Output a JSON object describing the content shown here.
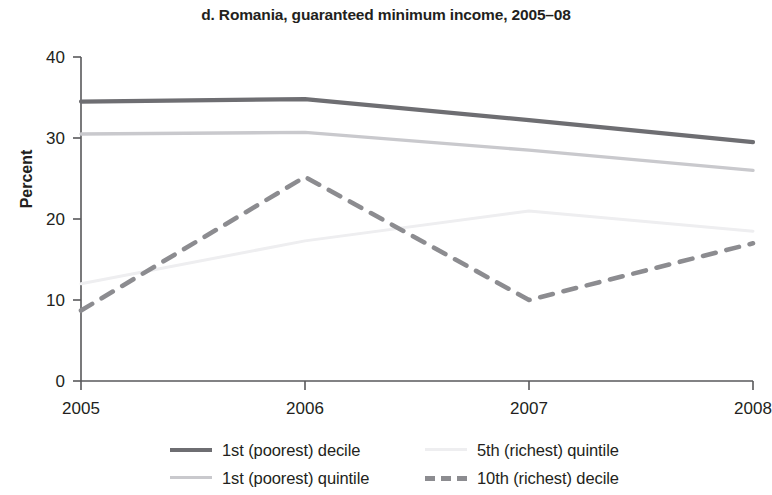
{
  "chart_data": {
    "type": "line",
    "title": "d. Romania, guaranteed minimum income, 2005–08",
    "xlabel": "",
    "ylabel": "Percent",
    "x": [
      2005,
      2006,
      2007,
      2008
    ],
    "xtick_labels": [
      "2005",
      "2006",
      "2007",
      "2008"
    ],
    "ytick_labels": [
      "0",
      "10",
      "20",
      "30",
      "40"
    ],
    "ytick_values": [
      0,
      10,
      20,
      30,
      40
    ],
    "ylim": [
      0,
      40
    ],
    "xlim": [
      2005,
      2008
    ],
    "grid": false,
    "legend_position": "bottom",
    "series": [
      {
        "name": "1st (poorest) decile",
        "values": [
          34.5,
          34.8,
          32.2,
          29.5
        ],
        "color": "#6e6e72",
        "style": "solid",
        "width": 4.2
      },
      {
        "name": "1st (poorest) quintile",
        "values": [
          30.5,
          30.7,
          28.5,
          26.0
        ],
        "color": "#c9c9cd",
        "style": "solid",
        "width": 3.4
      },
      {
        "name": "5th (richest) quintile",
        "values": [
          12.0,
          17.3,
          21.0,
          18.5
        ],
        "color": "#eeeef0",
        "style": "solid",
        "width": 3.0
      },
      {
        "name": "10th (richest) decile",
        "values": [
          8.7,
          25.2,
          10.0,
          17.0
        ],
        "color": "#8c8c90",
        "style": "dashed",
        "width": 4.6
      }
    ]
  },
  "legend": {
    "entries": [
      {
        "label": "1st (poorest) decile",
        "color": "#6e6e72",
        "style": "solid"
      },
      {
        "label": "5th (richest) quintile",
        "color": "#eeeef0",
        "style": "solid"
      },
      {
        "label": "1st (poorest) quintile",
        "color": "#c9c9cd",
        "style": "solid"
      },
      {
        "label": "10th (richest) decile",
        "color": "#8c8c90",
        "style": "dashed"
      }
    ]
  },
  "axes": {
    "axis_color": "#58585b"
  }
}
